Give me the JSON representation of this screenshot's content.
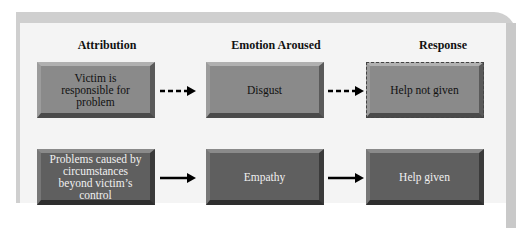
{
  "headers": {
    "attribution": "Attribution",
    "emotion": "Emotion Aroused",
    "response": "Response"
  },
  "rows": [
    {
      "attribution": "Victim is responsible for problem",
      "emotion": "Disgust",
      "response": "Help not given",
      "arrow_style": "dashed"
    },
    {
      "attribution": "Problems caused by circumstances beyond victim’s control",
      "emotion": "Empathy",
      "response": "Help given",
      "arrow_style": "solid"
    }
  ]
}
